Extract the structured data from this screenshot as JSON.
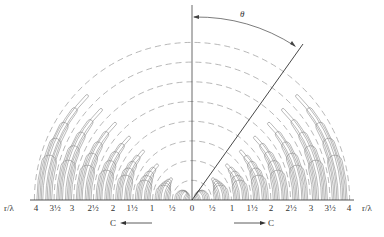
{
  "figure": {
    "type": "polar field-line diagram (half-plane, upper)",
    "angle_label": "θ",
    "axis_unit_label_left": "r/λ",
    "axis_unit_label_right": "r/λ",
    "ticks_left": [
      "4",
      "3½",
      "3",
      "2½",
      "2",
      "1½",
      "1",
      "½"
    ],
    "tick_center": "0",
    "ticks_right": [
      "½",
      "1",
      "1½",
      "2",
      "2½",
      "3",
      "3½",
      "4"
    ],
    "arrow_left_label": "C",
    "arrow_right_label": "C",
    "colors": {
      "lines": "#8a8a8a",
      "axis": "#444444",
      "background": "#ffffff"
    }
  }
}
